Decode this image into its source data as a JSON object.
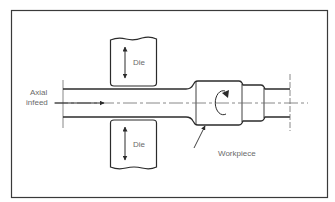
{
  "diagram": {
    "type": "process-schematic",
    "labels": {
      "axial_infeed_line1": "Axial",
      "axial_infeed_line2": "infeed",
      "die_top": "Die",
      "die_bottom": "Die",
      "workpiece": "Workpiece"
    },
    "elements": [
      {
        "name": "top-die",
        "label": "Die",
        "motion": "vertical double arrow"
      },
      {
        "name": "bottom-die",
        "label": "Die",
        "motion": "vertical double arrow"
      },
      {
        "name": "bar-stock",
        "direction": "axial infeed arrow pointing right along centerline"
      },
      {
        "name": "workpiece",
        "label": "Workpiece",
        "feature": "rotation arrow (clockwise)"
      }
    ],
    "colors": {
      "line": "#2b2b2b",
      "text": "#6a6a6a",
      "frame": "#3a3a3a",
      "background": "#ffffff"
    }
  }
}
